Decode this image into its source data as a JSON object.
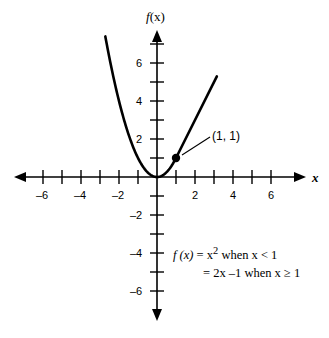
{
  "chart_data": {
    "type": "line",
    "title": "",
    "xlabel": "x",
    "ylabel": "f (x)",
    "xlim": [
      -7.5,
      7.5
    ],
    "ylim": [
      -7.5,
      7.8
    ],
    "grid": false,
    "legend": "none",
    "x_ticks": [
      -7,
      -6,
      -5,
      -4,
      -3,
      -2,
      -1,
      1,
      2,
      3,
      4,
      5,
      6,
      7
    ],
    "y_ticks": [
      -7,
      -6,
      -5,
      -4,
      -3,
      -2,
      -1,
      1,
      2,
      3,
      4,
      5,
      6,
      7
    ],
    "x_tick_labels": [
      "–6",
      "–4",
      "–2",
      "2",
      "4",
      "6"
    ],
    "x_tick_label_values": [
      -6,
      -4,
      -2,
      2,
      4,
      6
    ],
    "y_tick_labels": [
      "6",
      "4",
      "2",
      "–2",
      "–4",
      "–6"
    ],
    "y_tick_label_values": [
      6,
      4,
      2,
      -2,
      -4,
      -6
    ],
    "series": [
      {
        "name": "f(x) = x^2 when x < 1",
        "type": "parabola",
        "domain": [
          -2.72,
          1
        ],
        "equation": "y = x^2"
      },
      {
        "name": "f(x) = 2x - 1 when x >= 1",
        "type": "line",
        "domain": [
          1,
          3.15
        ],
        "equation": "y = 2x - 1"
      }
    ],
    "annotations": [
      {
        "label": "(1, 1)",
        "point": [
          1,
          1
        ],
        "marker": "filled-circle"
      }
    ]
  },
  "axes": {
    "x_name": "x",
    "y_name_f": "f",
    "y_name_arg": "(x)"
  },
  "tick_labels": {
    "x": [
      {
        "value": -6,
        "text": "–6"
      },
      {
        "value": -4,
        "text": "–4"
      },
      {
        "value": -2,
        "text": "–2"
      },
      {
        "value": 2,
        "text": "2"
      },
      {
        "value": 4,
        "text": "4"
      },
      {
        "value": 6,
        "text": "6"
      }
    ],
    "y": [
      {
        "value": 6,
        "text": "6"
      },
      {
        "value": 4,
        "text": "4"
      },
      {
        "value": 2,
        "text": "2"
      },
      {
        "value": -2,
        "text": "–2"
      },
      {
        "value": -4,
        "text": "–4"
      },
      {
        "value": -6,
        "text": "–6"
      }
    ]
  },
  "annotation": {
    "point_label": "(1, 1)"
  },
  "equation": {
    "line1_fx": "f (x)",
    "line1_rest": " = x",
    "line1_exp": "2",
    "line1_tail": " when x < 1",
    "line2": "= 2x –1  when x ≥ 1"
  }
}
